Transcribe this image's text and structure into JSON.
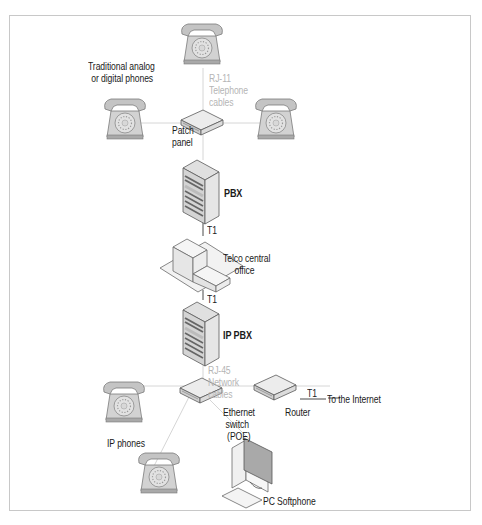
{
  "diagram": {
    "type": "network-topology",
    "labels": {
      "traditional_phones_line1": "Traditional analog",
      "traditional_phones_line2": "or digital phones",
      "rj11_line1": "RJ-11",
      "rj11_line2": "Telephone",
      "rj11_line3": "cables",
      "patch_panel_line1": "Patch",
      "patch_panel_line2": "panel",
      "pbx": "PBX",
      "t1_upper": "T1",
      "telco_line1": "Telco central",
      "telco_line2": "office",
      "t1_lower": "T1",
      "ip_pbx": "IP PBX",
      "rj45_line1": "RJ-45",
      "rj45_line2": "Network",
      "rj45_line3": "cables",
      "t1_router": "T1",
      "internet": "To the Internet",
      "router": "Router",
      "switch_line1": "Ethernet",
      "switch_line2": "switch",
      "switch_line3": "(POE)",
      "ip_phones": "IP phones",
      "pc_softphone": "PC Softphone"
    },
    "nodes": [
      {
        "id": "phone-top",
        "kind": "telephone"
      },
      {
        "id": "phone-left",
        "kind": "telephone"
      },
      {
        "id": "phone-right",
        "kind": "telephone"
      },
      {
        "id": "patch-panel",
        "kind": "patch-panel"
      },
      {
        "id": "pbx",
        "kind": "server"
      },
      {
        "id": "telco-central-office",
        "kind": "building"
      },
      {
        "id": "ip-pbx",
        "kind": "server"
      },
      {
        "id": "ethernet-switch",
        "kind": "switch"
      },
      {
        "id": "router",
        "kind": "router"
      },
      {
        "id": "ip-phone-1",
        "kind": "telephone"
      },
      {
        "id": "ip-phone-2",
        "kind": "telephone"
      },
      {
        "id": "pc-softphone",
        "kind": "computer"
      }
    ],
    "edges": [
      {
        "from": "phone-top",
        "to": "patch-panel",
        "label": "RJ-11 Telephone cables"
      },
      {
        "from": "phone-left",
        "to": "patch-panel"
      },
      {
        "from": "phone-right",
        "to": "patch-panel"
      },
      {
        "from": "patch-panel",
        "to": "pbx"
      },
      {
        "from": "pbx",
        "to": "telco-central-office",
        "label": "T1"
      },
      {
        "from": "telco-central-office",
        "to": "ip-pbx",
        "label": "T1"
      },
      {
        "from": "ip-pbx",
        "to": "ethernet-switch",
        "label": "RJ-45 Network cables"
      },
      {
        "from": "ethernet-switch",
        "to": "router"
      },
      {
        "from": "router",
        "to": "internet",
        "label": "T1"
      },
      {
        "from": "ethernet-switch",
        "to": "ip-phone-1"
      },
      {
        "from": "ethernet-switch",
        "to": "ip-phone-2"
      },
      {
        "from": "ethernet-switch",
        "to": "pc-softphone"
      }
    ],
    "colors": {
      "frame": "#c8c8c8",
      "line_light": "#d6d6d6",
      "line_dark": "#4a4a4a",
      "device_fill": "#e8e8e8",
      "phone_fill": "#cfcfcf",
      "cable_label": "#b5b5b5"
    }
  }
}
